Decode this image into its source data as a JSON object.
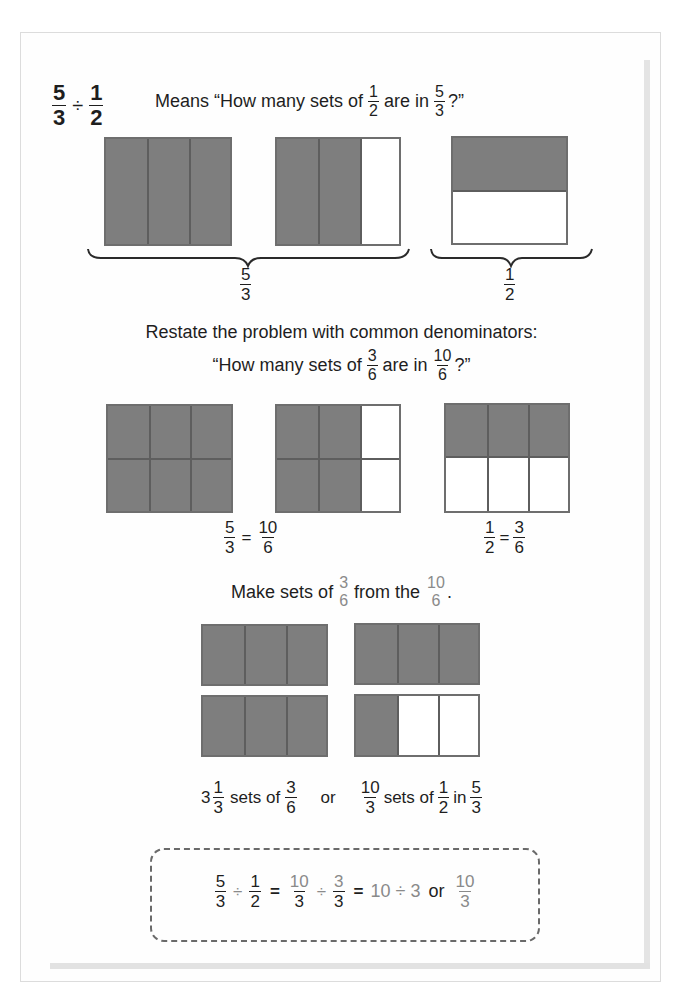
{
  "title": {
    "problem": {
      "a_num": "5",
      "a_den": "3",
      "op": "÷",
      "b_num": "1",
      "b_den": "2"
    },
    "meaning_prefix": "Means “How many sets of",
    "meaning_frac1": {
      "num": "1",
      "den": "2"
    },
    "meaning_mid": "are in",
    "meaning_frac2": {
      "num": "5",
      "den": "3"
    },
    "meaning_suffix": "?”"
  },
  "section1": {
    "left_label": {
      "num": "5",
      "den": "3"
    },
    "right_label": {
      "num": "1",
      "den": "2"
    }
  },
  "section2": {
    "restate_line": "Restate the problem with common denominators:",
    "question_prefix": "“How many sets of",
    "question_frac1": {
      "num": "3",
      "den": "6"
    },
    "question_mid": "are in",
    "question_frac2": {
      "num": "10",
      "den": "6"
    },
    "question_suffix": "?”",
    "left_eq": {
      "a_num": "5",
      "a_den": "3",
      "eq": "=",
      "b_num": "10",
      "b_den": "6"
    },
    "right_eq": {
      "a_num": "1",
      "a_den": "2",
      "eq": "=",
      "b_num": "3",
      "b_den": "6"
    }
  },
  "section3": {
    "prefix": "Make sets of",
    "frac1": {
      "num": "3",
      "den": "6"
    },
    "mid": "from the",
    "frac2": {
      "num": "10",
      "den": "6"
    },
    "suffix": "."
  },
  "summary": {
    "whole": "3",
    "mixed_frac": {
      "num": "1",
      "den": "3"
    },
    "sets_of": "sets of",
    "frac_a": {
      "num": "3",
      "den": "6"
    },
    "or": "or",
    "frac_b": {
      "num": "10",
      "den": "3"
    },
    "sets_of_2": "sets of",
    "frac_c": {
      "num": "1",
      "den": "2"
    },
    "in": "in",
    "frac_d": {
      "num": "5",
      "den": "3"
    }
  },
  "equation": {
    "f1": {
      "num": "5",
      "den": "3"
    },
    "div1": "÷",
    "f2": {
      "num": "1",
      "den": "2"
    },
    "eq1": "=",
    "f3": {
      "num": "10",
      "den": "3"
    },
    "div2": "÷",
    "f4": {
      "num": "3",
      "den": "3"
    },
    "eq2": "=",
    "whole_div": "10 ÷ 3",
    "or": "or",
    "f5": {
      "num": "10",
      "den": "3"
    }
  },
  "colors": {
    "shaded": "#7e7e7e",
    "border": "#6e6e6e",
    "gray_text": "#8a8a8a",
    "text": "#1e1e1e"
  }
}
